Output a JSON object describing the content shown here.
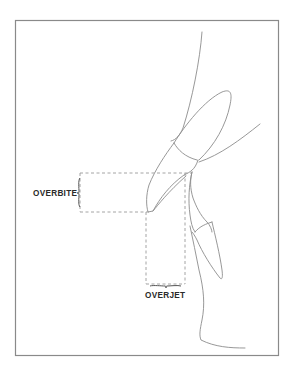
{
  "diagram": {
    "labels": {
      "overbite": "OVERBITE",
      "overjet": "OVERJET"
    },
    "elements": [
      "upper-lip-outline",
      "upper-incisor-crown",
      "upper-incisor-root",
      "upper-alveolar-outline",
      "lower-incisor-crown",
      "lower-incisor-root",
      "lower-lip-chin-outline",
      "overbite-measurement-box",
      "overjet-measurement-box"
    ],
    "colors": {
      "line": "#8c8c8c",
      "frame": "#8a8a8a",
      "text": "#2a2a2a"
    }
  }
}
